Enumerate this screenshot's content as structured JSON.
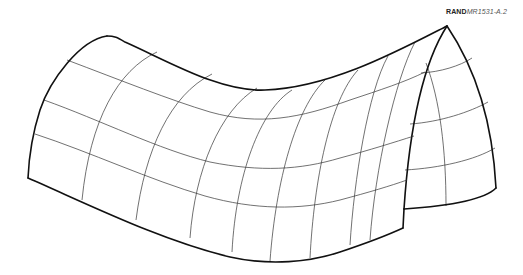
{
  "figure": {
    "label_brand": "RAND",
    "label_code": "MR1531-A.2",
    "stroke_color": "#111111",
    "background": "#ffffff"
  }
}
